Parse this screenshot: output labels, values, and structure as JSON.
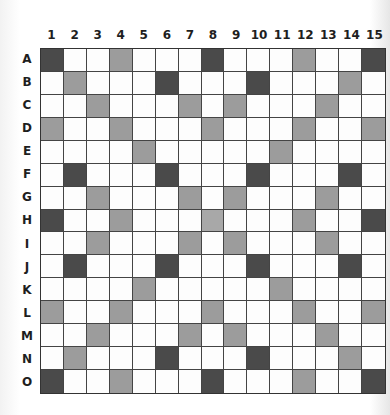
{
  "board": {
    "columns": [
      "1",
      "2",
      "3",
      "4",
      "5",
      "6",
      "7",
      "8",
      "9",
      "10",
      "11",
      "12",
      "13",
      "14",
      "15"
    ],
    "rows": [
      "A",
      "B",
      "C",
      "D",
      "E",
      "F",
      "G",
      "H",
      "I",
      "J",
      "K",
      "L",
      "M",
      "N",
      "O"
    ],
    "colors": {
      "dark": "#4a4a4a",
      "light": "#9c9c9c",
      "empty": "#fdfdfd",
      "grid": "#444444"
    },
    "cells": {
      "A": [
        "dark",
        "",
        "",
        "light",
        "",
        "",
        "",
        "dark",
        "",
        "",
        "",
        "light",
        "",
        "",
        "dark"
      ],
      "B": [
        "",
        "light",
        "",
        "",
        "",
        "dark",
        "",
        "",
        "",
        "dark",
        "",
        "",
        "",
        "light",
        ""
      ],
      "C": [
        "",
        "",
        "light",
        "",
        "",
        "",
        "light",
        "",
        "light",
        "",
        "",
        "",
        "light",
        "",
        ""
      ],
      "D": [
        "light",
        "",
        "",
        "light",
        "",
        "",
        "",
        "light",
        "",
        "",
        "",
        "light",
        "",
        "",
        "light"
      ],
      "E": [
        "",
        "",
        "",
        "",
        "light",
        "",
        "",
        "",
        "",
        "",
        "light",
        "",
        "",
        "",
        ""
      ],
      "F": [
        "",
        "dark",
        "",
        "",
        "",
        "dark",
        "",
        "",
        "",
        "dark",
        "",
        "",
        "",
        "dark",
        ""
      ],
      "G": [
        "",
        "",
        "light",
        "",
        "",
        "",
        "light",
        "",
        "light",
        "",
        "",
        "",
        "light",
        "",
        ""
      ],
      "H": [
        "dark",
        "",
        "",
        "light",
        "",
        "",
        "",
        "center",
        "",
        "",
        "",
        "light",
        "",
        "",
        "dark"
      ],
      "I": [
        "",
        "",
        "light",
        "",
        "",
        "",
        "light",
        "",
        "light",
        "",
        "",
        "",
        "light",
        "",
        ""
      ],
      "J": [
        "",
        "dark",
        "",
        "",
        "",
        "dark",
        "",
        "",
        "",
        "dark",
        "",
        "",
        "",
        "dark",
        ""
      ],
      "K": [
        "",
        "",
        "",
        "",
        "light",
        "",
        "",
        "",
        "",
        "",
        "light",
        "",
        "",
        "",
        ""
      ],
      "L": [
        "light",
        "",
        "",
        "light",
        "",
        "",
        "",
        "light",
        "",
        "",
        "",
        "light",
        "",
        "",
        "light"
      ],
      "M": [
        "",
        "",
        "light",
        "",
        "",
        "",
        "light",
        "",
        "light",
        "",
        "",
        "",
        "light",
        "",
        ""
      ],
      "N": [
        "",
        "light",
        "",
        "",
        "",
        "dark",
        "",
        "",
        "",
        "dark",
        "",
        "",
        "",
        "light",
        ""
      ],
      "O": [
        "dark",
        "",
        "",
        "light",
        "",
        "",
        "",
        "dark",
        "",
        "",
        "",
        "light",
        "",
        "",
        "dark"
      ]
    }
  }
}
